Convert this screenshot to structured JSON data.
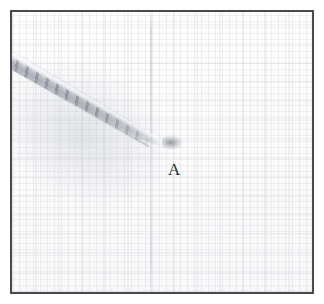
{
  "figure": {
    "caption_visible": false,
    "background_color": "#fdfdfd",
    "frame_color": "#4a4a4e",
    "object_color": "#9ea3ad",
    "label_color": "#2e2e31",
    "annotations": [
      {
        "id": "label-a",
        "text": "A",
        "x": 156,
        "y": 149,
        "points_to": "tip-of-diagonal-object"
      }
    ],
    "object": {
      "name": "diagonal-tapered-object",
      "description": "light-gray elongated banded object running from upper-left edge to a point near center",
      "start_x": 0,
      "start_y": 38,
      "tip_x": 158,
      "tip_y": 132,
      "angle_degrees": 29.5
    }
  }
}
